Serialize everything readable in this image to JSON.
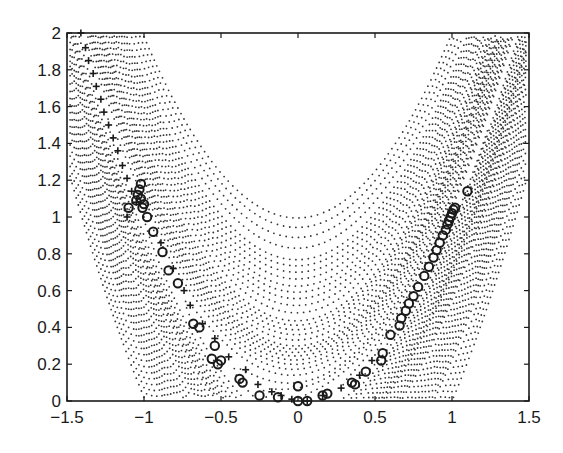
{
  "chart_data": {
    "type": "scatter",
    "title": "",
    "xlabel": "",
    "ylabel": "",
    "xlim": [
      -1.5,
      1.5
    ],
    "ylim": [
      0,
      2
    ],
    "grid": false,
    "legend": null,
    "x_ticks": [
      -1.5,
      -1,
      -0.5,
      0,
      0.5,
      1,
      1.5
    ],
    "x_tick_labels": [
      "−1.5",
      "−1",
      "−0.5",
      "0",
      "0.5",
      "1",
      "1.5"
    ],
    "y_ticks": [
      0,
      0.2,
      0.4,
      0.6,
      0.8,
      1,
      1.2,
      1.4,
      1.6,
      1.8,
      2
    ],
    "y_tick_labels": [
      "0",
      "0.2",
      "0.4",
      "0.6",
      "0.8",
      "1",
      "1.2",
      "1.4",
      "1.6",
      "1.8",
      "2"
    ],
    "background_contours": {
      "style": "dotted",
      "description": "Dotted contour lines of a Rosenbrock-type banana function centered on the valley y = x^2",
      "levels": [
        0.25,
        0.5,
        1,
        1.5,
        2,
        3,
        4,
        5,
        6,
        7,
        8,
        9,
        10,
        12,
        14,
        16,
        18,
        20,
        24,
        28,
        32,
        36,
        40,
        45,
        50,
        55,
        60,
        70,
        80,
        90,
        100
      ]
    },
    "series": [
      {
        "name": "plus-path",
        "marker": "+",
        "points": [
          [
            -1.41,
            2.0
          ],
          [
            -1.38,
            1.92
          ],
          [
            -1.36,
            1.85
          ],
          [
            -1.33,
            1.78
          ],
          [
            -1.31,
            1.71
          ],
          [
            -1.28,
            1.64
          ],
          [
            -1.26,
            1.57
          ],
          [
            -1.23,
            1.5
          ],
          [
            -1.2,
            1.43
          ],
          [
            -1.17,
            1.36
          ],
          [
            -1.14,
            1.28
          ],
          [
            -1.11,
            1.21
          ],
          [
            -1.08,
            1.14
          ],
          [
            -1.05,
            1.08
          ],
          [
            -1.11,
            1.0
          ],
          [
            -0.89,
            0.86
          ],
          [
            -0.81,
            0.72
          ],
          [
            -0.74,
            0.6
          ],
          [
            -0.7,
            0.52
          ],
          [
            -0.62,
            0.42
          ],
          [
            -0.54,
            0.34
          ],
          [
            -0.45,
            0.24
          ],
          [
            -0.34,
            0.17
          ],
          [
            -0.26,
            0.09
          ],
          [
            -0.17,
            0.05
          ],
          [
            -0.11,
            0.03
          ],
          [
            -0.04,
            0.01
          ],
          [
            0.06,
            0.0
          ],
          [
            0.16,
            0.03
          ],
          [
            0.28,
            0.07
          ],
          [
            0.4,
            0.14
          ],
          [
            0.48,
            0.22
          ]
        ]
      },
      {
        "name": "circle-samples",
        "marker": "o",
        "points": [
          [
            -1.1,
            1.05
          ],
          [
            -1.02,
            1.18
          ],
          [
            -1.04,
            1.12
          ],
          [
            -1.05,
            1.09
          ],
          [
            -1.02,
            1.1
          ],
          [
            -1.0,
            1.07
          ],
          [
            -1.03,
            1.15
          ],
          [
            -1.01,
            1.05
          ],
          [
            -0.98,
            1.0
          ],
          [
            -0.94,
            0.92
          ],
          [
            -0.88,
            0.81
          ],
          [
            -0.84,
            0.71
          ],
          [
            -0.78,
            0.64
          ],
          [
            -0.68,
            0.42
          ],
          [
            -0.64,
            0.4
          ],
          [
            -0.54,
            0.3
          ],
          [
            -0.56,
            0.23
          ],
          [
            -0.52,
            0.2
          ],
          [
            -0.5,
            0.22
          ],
          [
            -0.38,
            0.12
          ],
          [
            -0.36,
            0.1
          ],
          [
            -0.25,
            0.03
          ],
          [
            -0.13,
            0.02
          ],
          [
            0.0,
            0.08
          ],
          [
            0.0,
            0.0
          ],
          [
            0.06,
            0.0
          ],
          [
            0.16,
            0.03
          ],
          [
            0.19,
            0.04
          ],
          [
            0.35,
            0.1
          ],
          [
            0.37,
            0.09
          ],
          [
            0.44,
            0.16
          ],
          [
            0.54,
            0.22
          ],
          [
            0.55,
            0.26
          ],
          [
            0.6,
            0.36
          ],
          [
            0.67,
            0.45
          ],
          [
            0.66,
            0.41
          ],
          [
            0.7,
            0.49
          ],
          [
            0.72,
            0.53
          ],
          [
            0.75,
            0.57
          ],
          [
            0.78,
            0.62
          ],
          [
            0.82,
            0.68
          ],
          [
            0.85,
            0.73
          ],
          [
            0.88,
            0.78
          ],
          [
            0.9,
            0.82
          ],
          [
            0.92,
            0.86
          ],
          [
            0.94,
            0.9
          ],
          [
            0.96,
            0.93
          ],
          [
            0.97,
            0.96
          ],
          [
            0.98,
            0.98
          ],
          [
            0.99,
            1.0
          ],
          [
            1.0,
            1.02
          ],
          [
            1.01,
            1.04
          ],
          [
            1.02,
            1.05
          ],
          [
            1.1,
            1.14
          ]
        ]
      }
    ]
  }
}
